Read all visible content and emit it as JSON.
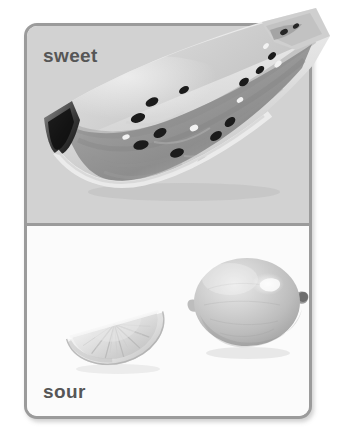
{
  "card": {
    "panels": [
      {
        "id": "sweet",
        "label": "sweet",
        "label_position": "top-left",
        "background_color": "#d2d2d2",
        "image": {
          "name": "watermelon-slice-image",
          "alt": "watermelon slice",
          "description": "grayscale photo of a watermelon wedge with dark seeds, cut flesh facing viewer, extending past the top-right card edge"
        }
      },
      {
        "id": "sour",
        "label": "sour",
        "label_position": "bottom-left",
        "background_color": "#fbfbfb",
        "images": [
          {
            "name": "lemon-wedge-image",
            "alt": "lemon wedge",
            "description": "grayscale photo of a half-slice lemon wedge showing pulp segments and rind"
          },
          {
            "name": "lemon-whole-image",
            "alt": "whole lemon",
            "description": "grayscale photo of a whole lemon with nipple ends and a bright highlight"
          }
        ]
      }
    ],
    "border_color": "#9b9b9b",
    "label_color": "#565656",
    "background_color": "#ffffff"
  }
}
